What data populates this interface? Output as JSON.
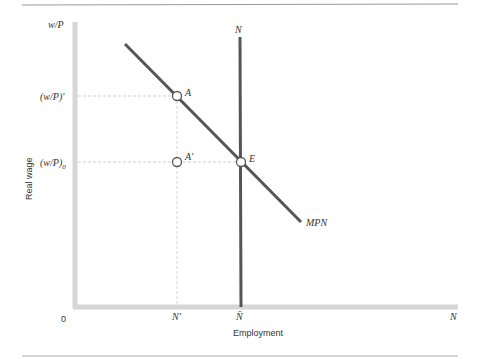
{
  "diagram": {
    "y_axis": {
      "top_label": "w/P",
      "title": "Real wage"
    },
    "x_axis": {
      "origin_label": "0",
      "right_label": "N",
      "title": "Employment"
    },
    "y_ticks": [
      {
        "label": "(w/P)'",
        "level": "high"
      },
      {
        "label": "(w/P)0",
        "base": "(w/P)",
        "sub": "0",
        "level": "equilibrium"
      }
    ],
    "x_ticks": [
      {
        "label": "N'"
      },
      {
        "label": "N̄"
      }
    ],
    "curves": [
      {
        "name": "MPN",
        "label": "MPN",
        "type": "downward-sloping labor demand"
      },
      {
        "name": "N",
        "label": "N",
        "type": "vertical labor supply at N̄"
      }
    ],
    "points": [
      {
        "label": "A",
        "desc": "on MPN at (w/P)' and N'"
      },
      {
        "label": "A'",
        "desc": "at N' and (w/P)0, off curve"
      },
      {
        "label": "E",
        "desc": "equilibrium at N̄ and (w/P)0"
      }
    ],
    "colors": {
      "curve": "#555555",
      "axis": "#d4d4d4",
      "guide": "#cccccc",
      "rule": "#999999"
    }
  }
}
